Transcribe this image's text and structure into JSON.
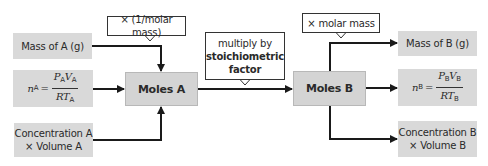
{
  "diagram": {
    "inputs_a": [
      {
        "id": "mass-a",
        "label": "Mass of A (g)"
      },
      {
        "id": "gas-a",
        "formula": {
          "lhs": "n",
          "lhs_sub": "A",
          "num_p": "P",
          "num_p_sub": "A",
          "num_v": "V",
          "num_v_sub": "A",
          "den_rt": "RT",
          "den_sub": "A"
        }
      },
      {
        "id": "conc-a",
        "line1": "Concentration A",
        "line2": "× Volume A"
      }
    ],
    "moles_a": "Moles A",
    "moles_b": "Moles B",
    "callouts": {
      "inv_molar_mass": "× (1/molar mass)",
      "stoich_line1": "multiply by",
      "stoich_line2": "stoichiometric",
      "stoich_line3": "factor",
      "molar_mass": "× molar mass"
    },
    "outputs_b": [
      {
        "id": "mass-b",
        "label": "Mass of B (g)"
      },
      {
        "id": "gas-b",
        "formula": {
          "lhs": "n",
          "lhs_sub": "B",
          "num_p": "P",
          "num_p_sub": "B",
          "num_v": "V",
          "num_v_sub": "B",
          "den_rt": "RT",
          "den_sub": "B"
        }
      },
      {
        "id": "conc-b",
        "line1": "Concentration B",
        "line2": "× Volume B"
      }
    ],
    "colors": {
      "box_fill": "#d9d9d9",
      "line": "#1a1a1a",
      "callout_border": "#333333"
    }
  }
}
